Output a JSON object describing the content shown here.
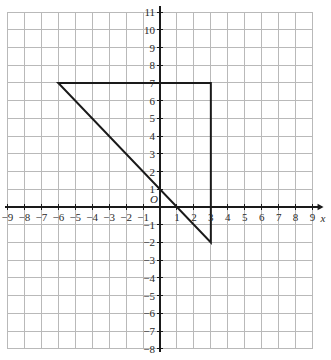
{
  "chart_data": {
    "type": "scatter",
    "title": "",
    "xlabel": "x",
    "ylabel": "",
    "origin_label": "O",
    "xlim": [
      -9,
      9
    ],
    "ylim": [
      -8,
      11
    ],
    "grid": true,
    "grid_step": 1,
    "legend": "none",
    "x_ticks": [
      "−9",
      "−8",
      "−7",
      "−6",
      "−5",
      "−4",
      "−3",
      "−2",
      "−1",
      "1",
      "2",
      "3",
      "4",
      "5",
      "6",
      "7",
      "8",
      "9"
    ],
    "x_tick_values": [
      -9,
      -8,
      -7,
      -6,
      -5,
      -4,
      -3,
      -2,
      -1,
      1,
      2,
      3,
      4,
      5,
      6,
      7,
      8,
      9
    ],
    "y_ticks": [
      "11",
      "10",
      "9",
      "8",
      "7",
      "6",
      "5",
      "4",
      "3",
      "2",
      "1",
      "−1",
      "−2",
      "−3",
      "−4",
      "−5",
      "−6",
      "−7",
      "−8"
    ],
    "y_tick_values": [
      11,
      10,
      9,
      8,
      7,
      6,
      5,
      4,
      3,
      2,
      1,
      -1,
      -2,
      -3,
      -4,
      -5,
      -6,
      -7,
      -8
    ],
    "shapes": [
      {
        "name": "triangle",
        "type": "polygon",
        "closed": true,
        "vertices": [
          [
            -6,
            7
          ],
          [
            3,
            7
          ],
          [
            3,
            -2
          ]
        ],
        "stroke": "#1a1a1a",
        "stroke_width": 2,
        "fill": "none"
      }
    ],
    "colors": {
      "grid": "#b9b9b9",
      "axis": "#1a1a1a",
      "shape": "#1a1a1a",
      "label": "#2a2a2a",
      "background": "#ffffff"
    }
  }
}
